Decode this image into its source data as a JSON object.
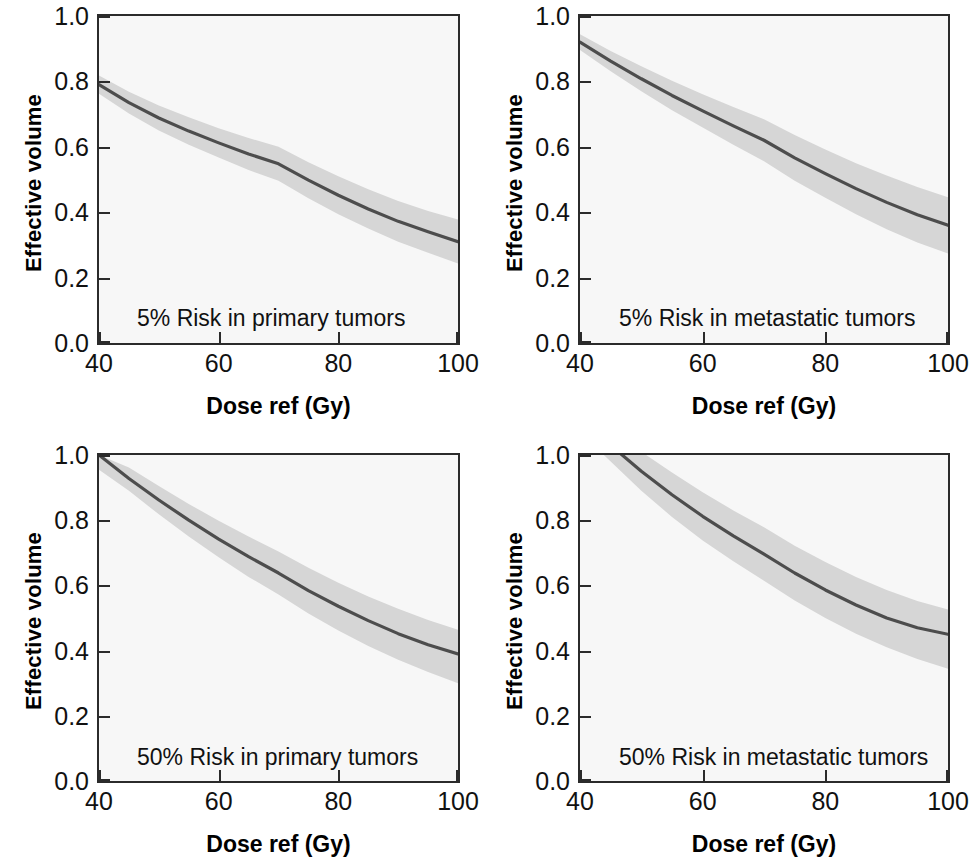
{
  "figure": {
    "kind": "multi-panel-line-chart",
    "rows": 2,
    "cols": 2,
    "band_color": "#d6d6d6",
    "line_color": "#4d4d4d",
    "frame_color": "#2b2b2b",
    "panel_background": "#f7f7f7",
    "page_background": "#ffffff"
  },
  "axes": {
    "x_label": "Dose ref (Gy)",
    "y_label": "Effective volume",
    "x_ticks": [
      "40",
      "60",
      "80",
      "100"
    ],
    "y_ticks": [
      "1.0",
      "0.8",
      "0.6",
      "0.4",
      "0.2",
      "0.0"
    ],
    "xlim": [
      40,
      100
    ],
    "ylim": [
      0.0,
      1.0
    ]
  },
  "panels": [
    {
      "id": "p1",
      "annotation": "5% Risk in primary tumors"
    },
    {
      "id": "p2",
      "annotation": "5% Risk in metastatic tumors"
    },
    {
      "id": "p3",
      "annotation": "50% Risk in primary tumors"
    },
    {
      "id": "p4",
      "annotation": "50% Risk in metastatic tumors"
    }
  ],
  "chart_data": [
    {
      "type": "line",
      "title": "5% Risk in primary tumors",
      "xlabel": "Dose ref (Gy)",
      "ylabel": "Effective volume",
      "xlim": [
        40,
        100
      ],
      "ylim": [
        0.0,
        1.0
      ],
      "grid": false,
      "legend": "none",
      "x": [
        40,
        45,
        50,
        55,
        60,
        65,
        70,
        75,
        80,
        85,
        90,
        95,
        100
      ],
      "series": [
        {
          "name": "fit",
          "values": [
            0.79,
            0.735,
            0.688,
            0.648,
            0.612,
            0.578,
            0.548,
            0.498,
            0.452,
            0.41,
            0.372,
            0.34,
            0.31
          ]
        },
        {
          "name": "upper_bound",
          "values": [
            0.818,
            0.768,
            0.726,
            0.69,
            0.657,
            0.627,
            0.6,
            0.553,
            0.51,
            0.47,
            0.434,
            0.404,
            0.378
          ]
        },
        {
          "name": "lower_bound",
          "values": [
            0.762,
            0.702,
            0.65,
            0.606,
            0.567,
            0.529,
            0.496,
            0.443,
            0.394,
            0.35,
            0.31,
            0.276,
            0.243
          ]
        }
      ]
    },
    {
      "type": "line",
      "title": "5% Risk in metastatic tumors",
      "xlabel": "Dose ref (Gy)",
      "ylabel": "Effective volume",
      "xlim": [
        40,
        100
      ],
      "ylim": [
        0.0,
        1.0
      ],
      "grid": false,
      "legend": "none",
      "x": [
        40,
        45,
        50,
        55,
        60,
        65,
        70,
        75,
        80,
        85,
        90,
        95,
        100
      ],
      "series": [
        {
          "name": "fit",
          "values": [
            0.92,
            0.862,
            0.808,
            0.757,
            0.71,
            0.664,
            0.62,
            0.566,
            0.518,
            0.472,
            0.43,
            0.392,
            0.36
          ]
        },
        {
          "name": "upper_bound",
          "values": [
            0.944,
            0.893,
            0.846,
            0.802,
            0.761,
            0.722,
            0.684,
            0.636,
            0.592,
            0.55,
            0.512,
            0.477,
            0.446
          ]
        },
        {
          "name": "lower_bound",
          "values": [
            0.896,
            0.831,
            0.77,
            0.712,
            0.659,
            0.606,
            0.556,
            0.496,
            0.444,
            0.394,
            0.348,
            0.307,
            0.274
          ]
        }
      ]
    },
    {
      "type": "line",
      "title": "50% Risk in primary tumors",
      "xlabel": "Dose ref (Gy)",
      "ylabel": "Effective volume",
      "xlim": [
        40,
        100
      ],
      "ylim": [
        0.0,
        1.0
      ],
      "grid": false,
      "legend": "none",
      "x": [
        40,
        45,
        50,
        55,
        60,
        65,
        70,
        75,
        80,
        85,
        90,
        95,
        100
      ],
      "series": [
        {
          "name": "fit",
          "values": [
            1.0,
            0.928,
            0.862,
            0.8,
            0.742,
            0.688,
            0.638,
            0.584,
            0.536,
            0.492,
            0.452,
            0.418,
            0.39
          ]
        },
        {
          "name": "upper_bound",
          "values": [
            1.0,
            0.962,
            0.905,
            0.85,
            0.798,
            0.75,
            0.704,
            0.654,
            0.608,
            0.566,
            0.528,
            0.494,
            0.464
          ]
        },
        {
          "name": "lower_bound",
          "values": [
            0.955,
            0.89,
            0.818,
            0.75,
            0.686,
            0.626,
            0.572,
            0.514,
            0.462,
            0.414,
            0.372,
            0.334,
            0.3
          ]
        }
      ]
    },
    {
      "type": "line",
      "title": "50% Risk in metastatic tumors",
      "xlabel": "Dose ref (Gy)",
      "ylabel": "Effective volume",
      "xlim": [
        40,
        100
      ],
      "ylim": [
        0.0,
        1.0
      ],
      "grid": false,
      "legend": "none",
      "x": [
        40,
        45,
        50,
        55,
        60,
        65,
        70,
        75,
        80,
        85,
        90,
        95,
        100
      ],
      "series": [
        {
          "name": "fit",
          "values": [
            1.11,
            1.03,
            0.95,
            0.878,
            0.812,
            0.752,
            0.696,
            0.638,
            0.586,
            0.54,
            0.5,
            0.47,
            0.45
          ]
        },
        {
          "name": "upper_bound",
          "values": [
            1.15,
            1.08,
            1.01,
            0.946,
            0.886,
            0.83,
            0.778,
            0.722,
            0.672,
            0.626,
            0.586,
            0.552,
            0.526
          ]
        },
        {
          "name": "lower_bound",
          "values": [
            1.07,
            0.98,
            0.89,
            0.81,
            0.738,
            0.674,
            0.614,
            0.554,
            0.5,
            0.452,
            0.41,
            0.374,
            0.344
          ]
        }
      ]
    }
  ]
}
